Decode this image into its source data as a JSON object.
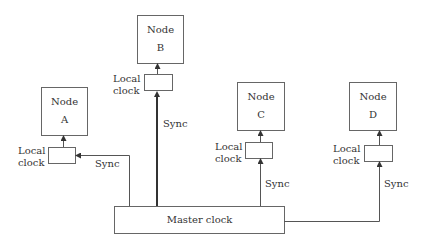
{
  "diagram": {
    "nodes": [
      {
        "title": "Node",
        "id": "A"
      },
      {
        "title": "Node",
        "id": "B"
      },
      {
        "title": "Node",
        "id": "C"
      },
      {
        "title": "Node",
        "id": "D"
      }
    ],
    "local_clock": {
      "line1": "Local",
      "line2": "clock"
    },
    "sync_label": "Sync",
    "master_clock": "Master clock",
    "colors": {
      "stroke": "#555555",
      "text": "#333333"
    }
  }
}
